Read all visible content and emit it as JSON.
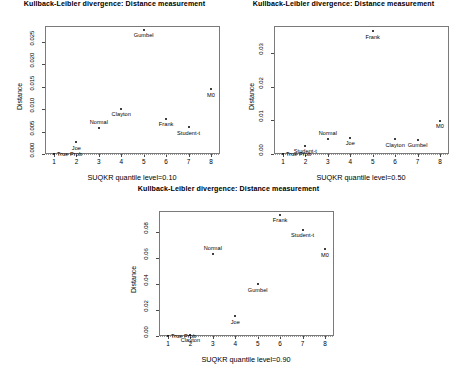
{
  "figure": {
    "title": "Kullback-Leibler divergence: Distance measurement",
    "panel_count": 3,
    "width": 458,
    "height": 373,
    "background": "#ffffff",
    "point_color": "#000000",
    "axis_color": "#4a4a4a"
  },
  "chart_data": [
    {
      "type": "scatter",
      "title": "Kullback-Leibler divergence: Distance measurement",
      "xlabel": "SUQKR quantile level=0.10",
      "ylabel": "Distance",
      "quantile_level": "0.10",
      "xlim": [
        0.6,
        8.4
      ],
      "ylim": [
        0.0,
        0.0285
      ],
      "xticks": [
        "1",
        "2",
        "3",
        "4",
        "5",
        "6",
        "7",
        "8"
      ],
      "xtick_values": [
        1,
        2,
        3,
        4,
        5,
        6,
        7,
        8
      ],
      "yticks": [
        "0.000",
        "0.005",
        "0.010",
        "0.015",
        "0.020",
        "0.025"
      ],
      "ytick_values": [
        0.0,
        0.005,
        0.01,
        0.015,
        0.02,
        0.025
      ],
      "grid": false,
      "legend": "none",
      "reference_line_y": 0.0,
      "points": [
        {
          "label": "True Prob",
          "x": 1,
          "y": 0.0,
          "label_pos": "right"
        },
        {
          "label": "Joe",
          "x": 2,
          "y": 0.0026,
          "label_pos": "below"
        },
        {
          "label": "Normal",
          "x": 3,
          "y": 0.0058,
          "label_pos": "above"
        },
        {
          "label": "Clayton",
          "x": 4,
          "y": 0.0101,
          "label_pos": "below"
        },
        {
          "label": "Gumbel",
          "x": 5,
          "y": 0.0277,
          "label_pos": "below"
        },
        {
          "label": "Frank",
          "x": 6,
          "y": 0.0079,
          "label_pos": "below"
        },
        {
          "label": "Student-t",
          "x": 7,
          "y": 0.006,
          "label_pos": "below"
        },
        {
          "label": "M0",
          "x": 8,
          "y": 0.0144,
          "label_pos": "below"
        }
      ]
    },
    {
      "type": "scatter",
      "title": "Kullback-Leibler divergence: Distance measurement",
      "xlabel": "SUQKR quantile level=0.50",
      "ylabel": "Distance",
      "quantile_level": "0.50",
      "xlim": [
        0.6,
        8.4
      ],
      "ylim": [
        0.0,
        0.0382
      ],
      "xticks": [
        "1",
        "2",
        "3",
        "4",
        "5",
        "6",
        "7",
        "8"
      ],
      "xtick_values": [
        1,
        2,
        3,
        4,
        5,
        6,
        7,
        8
      ],
      "yticks": [
        "0.00",
        "0.01",
        "0.02",
        "0.03"
      ],
      "ytick_values": [
        0.0,
        0.01,
        0.02,
        0.03
      ],
      "grid": false,
      "legend": "none",
      "reference_line_y": 0.0,
      "points": [
        {
          "label": "True Prob",
          "x": 1,
          "y": 0.0,
          "label_pos": "right"
        },
        {
          "label": "Student-t",
          "x": 2,
          "y": 0.0025,
          "label_pos": "below"
        },
        {
          "label": "Normal",
          "x": 3,
          "y": 0.0046,
          "label_pos": "above"
        },
        {
          "label": "Joe",
          "x": 4,
          "y": 0.0049,
          "label_pos": "below"
        },
        {
          "label": "Frank",
          "x": 5,
          "y": 0.0367,
          "label_pos": "below"
        },
        {
          "label": "Clayton",
          "x": 6,
          "y": 0.0044,
          "label_pos": "below"
        },
        {
          "label": "Gumbel",
          "x": 7,
          "y": 0.0042,
          "label_pos": "below"
        },
        {
          "label": "M0",
          "x": 8,
          "y": 0.0099,
          "label_pos": "below"
        }
      ]
    },
    {
      "type": "scatter",
      "title": "Kullback-Leibler divergence: Distance measurement",
      "xlabel": "SUQKR quantile level=0.90",
      "ylabel": "Distance",
      "quantile_level": "0.90",
      "xlim": [
        0.6,
        8.4
      ],
      "ylim": [
        0.0,
        0.0965
      ],
      "xticks": [
        "1",
        "2",
        "3",
        "4",
        "5",
        "6",
        "7",
        "8"
      ],
      "xtick_values": [
        1,
        2,
        3,
        4,
        5,
        6,
        7,
        8
      ],
      "yticks": [
        "0.00",
        "0.02",
        "0.04",
        "0.06",
        "0.08"
      ],
      "ytick_values": [
        0.0,
        0.02,
        0.04,
        0.06,
        0.08
      ],
      "grid": false,
      "legend": "none",
      "reference_line_y": 0.0,
      "points": [
        {
          "label": "True Prob",
          "x": 1,
          "y": 0.0,
          "label_pos": "right"
        },
        {
          "label": "Clayton",
          "x": 2,
          "y": 0.001,
          "label_pos": "below"
        },
        {
          "label": "Normal",
          "x": 3,
          "y": 0.063,
          "label_pos": "above"
        },
        {
          "label": "Joe",
          "x": 4,
          "y": 0.0152,
          "label_pos": "below"
        },
        {
          "label": "Gumbel",
          "x": 5,
          "y": 0.04,
          "label_pos": "below"
        },
        {
          "label": "Frank",
          "x": 6,
          "y": 0.0935,
          "label_pos": "below"
        },
        {
          "label": "Student-t",
          "x": 7,
          "y": 0.082,
          "label_pos": "below"
        },
        {
          "label": "M0",
          "x": 8,
          "y": 0.067,
          "label_pos": "below"
        }
      ]
    }
  ]
}
